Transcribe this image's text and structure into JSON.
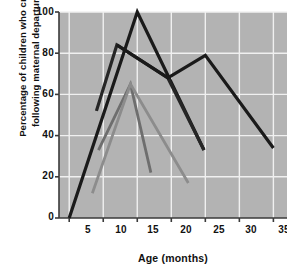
{
  "chart_data": {
    "type": "line",
    "title": "",
    "xlabel": "Age (months)",
    "ylabel_line1": "Percentage of children who cried",
    "ylabel_line2": "following maternal departure",
    "xlim": [
      3.5,
      37
    ],
    "ylim": [
      0,
      100
    ],
    "xticks": [
      5,
      10,
      15,
      20,
      25,
      30,
      35
    ],
    "yticks": [
      0,
      20,
      40,
      60,
      80,
      100
    ],
    "grid": true,
    "plot_background": "#b3b3b3",
    "grid_color": "#f0f0f0",
    "legend": "none",
    "series": [
      {
        "name": "Guatemala (Indian village)",
        "color": "#1a1a1a",
        "width": 3.2,
        "points": [
          [
            5,
            0
          ],
          [
            15,
            100
          ],
          [
            24.8,
            33
          ]
        ]
      },
      {
        "name": "Kalahari Desert (!Kung)",
        "color": "#262626",
        "width": 3.2,
        "points": [
          [
            9,
            52
          ],
          [
            12,
            84
          ],
          [
            19.5,
            68
          ],
          [
            24.8,
            33
          ]
        ]
      },
      {
        "name": "Israel (kibbutz)",
        "color": "#1a1a1a",
        "width": 3.2,
        "points": [
          [
            12,
            84
          ],
          [
            19.5,
            68
          ],
          [
            25,
            79
          ],
          [
            35,
            34
          ]
        ]
      },
      {
        "name": "United States (Antigua)",
        "color": "#6e6e6e",
        "width": 2.8,
        "points": [
          [
            9.3,
            33
          ],
          [
            14,
            65
          ],
          [
            17,
            22
          ]
        ]
      },
      {
        "name": "United States (home-reared)",
        "color": "#8c8c8c",
        "width": 2.8,
        "points": [
          [
            8.4,
            12
          ],
          [
            14,
            65
          ],
          [
            22.5,
            17
          ]
        ]
      }
    ]
  }
}
